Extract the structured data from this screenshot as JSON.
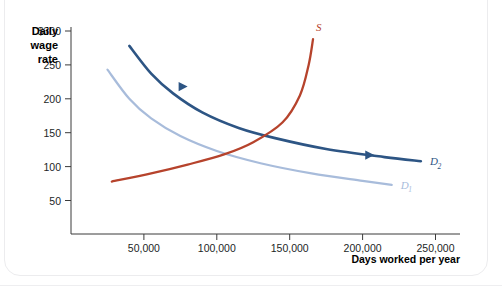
{
  "chart_data": {
    "type": "line",
    "title": "",
    "ylabel_lines": [
      "Daily",
      "wage",
      "rate"
    ],
    "xlabel": "Days worked per year",
    "xlim": [
      0,
      275000
    ],
    "ylim": [
      0,
      325
    ],
    "grid": false,
    "legend": "inline-curve-labels",
    "y_ticks": [
      {
        "label": "$300",
        "value": 300
      },
      {
        "label": "250",
        "value": 250
      },
      {
        "label": "200",
        "value": 200
      },
      {
        "label": "150",
        "value": 150
      },
      {
        "label": "100",
        "value": 100
      },
      {
        "label": "50",
        "value": 50
      }
    ],
    "x_ticks": [
      {
        "label": "50,000",
        "value": 50000
      },
      {
        "label": "100,000",
        "value": 100000
      },
      {
        "label": "150,000",
        "value": 150000
      },
      {
        "label": "200,000",
        "value": 200000
      },
      {
        "label": "250,000",
        "value": 250000
      }
    ],
    "series": [
      {
        "name": "D1",
        "label": "D",
        "sublabel": "1",
        "color": "#a8bcdb",
        "role": "demand-initial",
        "points": [
          {
            "x": 25000,
            "y": 243
          },
          {
            "x": 40000,
            "y": 200
          },
          {
            "x": 55000,
            "y": 171
          },
          {
            "x": 75000,
            "y": 145
          },
          {
            "x": 100000,
            "y": 123
          },
          {
            "x": 130000,
            "y": 105
          },
          {
            "x": 165000,
            "y": 90
          },
          {
            "x": 200000,
            "y": 79
          },
          {
            "x": 220000,
            "y": 73
          }
        ]
      },
      {
        "name": "D2",
        "label": "D",
        "sublabel": "2",
        "color": "#2d5584",
        "role": "demand-shifted",
        "points": [
          {
            "x": 40000,
            "y": 278
          },
          {
            "x": 55000,
            "y": 237
          },
          {
            "x": 70000,
            "y": 208
          },
          {
            "x": 90000,
            "y": 180
          },
          {
            "x": 115000,
            "y": 157
          },
          {
            "x": 140000,
            "y": 142
          },
          {
            "x": 175000,
            "y": 126
          },
          {
            "x": 215000,
            "y": 114
          },
          {
            "x": 240000,
            "y": 108
          }
        ]
      },
      {
        "name": "S",
        "label": "S",
        "sublabel": "",
        "color": "#b6432c",
        "role": "supply",
        "points": [
          {
            "x": 28000,
            "y": 78
          },
          {
            "x": 55000,
            "y": 90
          },
          {
            "x": 80000,
            "y": 103
          },
          {
            "x": 105000,
            "y": 118
          },
          {
            "x": 125000,
            "y": 136
          },
          {
            "x": 145000,
            "y": 165
          },
          {
            "x": 157000,
            "y": 205
          },
          {
            "x": 163000,
            "y": 250
          },
          {
            "x": 166000,
            "y": 288
          }
        ]
      }
    ],
    "shift_arrows": [
      {
        "name": "upper-shift-arrow",
        "from": {
          "x": 53000,
          "y": 218
        },
        "to": {
          "x": 80000,
          "y": 218
        },
        "color_start": "#dfe6f1",
        "color_end": "#2d5584"
      },
      {
        "name": "lower-shift-arrow",
        "from": {
          "x": 158000,
          "y": 117
        },
        "to": {
          "x": 208000,
          "y": 117
        },
        "color_start": "#dfe6f1",
        "color_end": "#2d5584"
      }
    ],
    "equilibria": [
      {
        "name": "initial-equilibrium",
        "x": 105000,
        "y": 118
      },
      {
        "name": "new-equilibrium",
        "x": 133000,
        "y": 147
      }
    ],
    "axis_color": "#3b3b3b"
  }
}
